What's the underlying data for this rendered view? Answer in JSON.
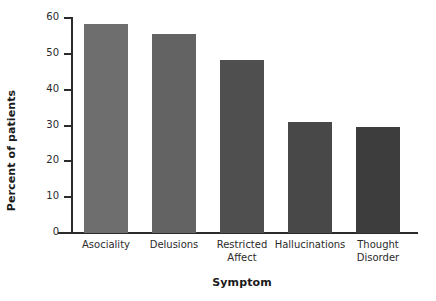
{
  "chart_data": {
    "type": "bar",
    "title": "",
    "subtitle": "",
    "xlabel": "Symptom",
    "ylabel": "Percent of patients",
    "categories": [
      "Asociality",
      "Delusions",
      "Restricted Affect",
      "Hallucinations",
      "Thought Disorder"
    ],
    "category_lines": [
      [
        "Asociality"
      ],
      [
        "Delusions"
      ],
      [
        "Restricted",
        "Affect"
      ],
      [
        "Hallucinations"
      ],
      [
        "Thought",
        "Disorder"
      ]
    ],
    "values": [
      58.3,
      55.4,
      48.2,
      31.0,
      29.5
    ],
    "bar_colors": [
      "#6e6e6e",
      "#636363",
      "#4f4f4f",
      "#484848",
      "#3d3d3d"
    ],
    "ylim": [
      0,
      60
    ],
    "yticks": [
      0,
      10,
      20,
      30,
      40,
      50,
      60
    ],
    "ytick_labels": [
      "0",
      "10",
      "20",
      "30",
      "40",
      "50",
      "60"
    ],
    "xlim_categories": 5,
    "grid": false,
    "legend": false,
    "legend_position": "none",
    "axis_color": "#2b2b2b",
    "background_color": "#ffffff",
    "text_color": "#1a1a1a"
  }
}
